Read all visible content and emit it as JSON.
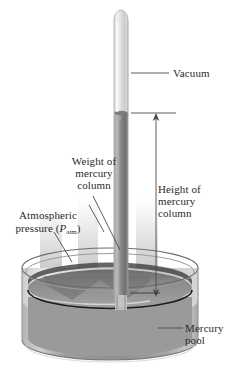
{
  "figure": {
    "background_color": "#ffffff"
  },
  "labels": {
    "vacuum": "Vacuum",
    "height_of_mercury_column": "Height of\nmercury\ncolumn",
    "weight_of_mercury_column": "Weight of\nmercury\ncolumn",
    "atmospheric_pressure_line1": "Atmospheric",
    "atmospheric_pressure_line2_prefix": "pressure (",
    "atmospheric_pressure_symbol": "P",
    "atmospheric_pressure_subscript": "atm",
    "atmospheric_pressure_line2_suffix": ")",
    "mercury_pool": "Mercury\npool"
  },
  "colors": {
    "text": "#2b2b2b",
    "leader_line": "#4a4a4a",
    "glass_light": "#e8e8e8",
    "glass_mid": "#cfcfcf",
    "mercury_dark": "#6e6e6e",
    "mercury_mid": "#8f8f8f",
    "mercury_light": "#a8a8a8",
    "pool_body": "#9a9a9a",
    "pool_surface": "#808080",
    "shadow": "#bdbdbd",
    "outline": "#3a3a3a"
  },
  "geometry": {
    "tube_x_center": 121,
    "tube_width": 14,
    "tube_top_y": 10,
    "mercury_top_y": 113,
    "pool_surface_y": 297,
    "dish_center_x": 110,
    "dish_rim_y": 268,
    "dish_bottom_y": 360,
    "dish_rx": 88,
    "dish_ry": 20,
    "measure_line_x": 156,
    "measure_top_y": 113,
    "measure_bottom_y": 297
  }
}
